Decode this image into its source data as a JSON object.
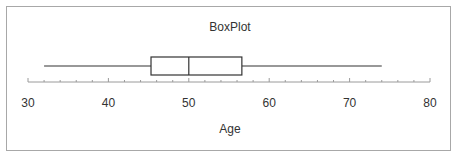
{
  "chart_data": {
    "type": "boxplot",
    "title": "BoxPlot",
    "xlabel": "Age",
    "ylabel": "",
    "orientation": "horizontal",
    "xlim": [
      30,
      80
    ],
    "ticks": [
      30,
      40,
      50,
      60,
      70,
      80
    ],
    "tick_labels": [
      "30",
      "40",
      "50",
      "60",
      "70",
      "80"
    ],
    "minor_tick_step": 2,
    "grid": false,
    "legend": null,
    "series": [
      {
        "name": "Age",
        "min": 32,
        "q1": 45.3,
        "median": 50,
        "q3": 56.6,
        "max": 74
      }
    ]
  },
  "colors": {
    "line": "#333333",
    "axis": "#9a9a9a",
    "frame": "#a8a8a8"
  }
}
